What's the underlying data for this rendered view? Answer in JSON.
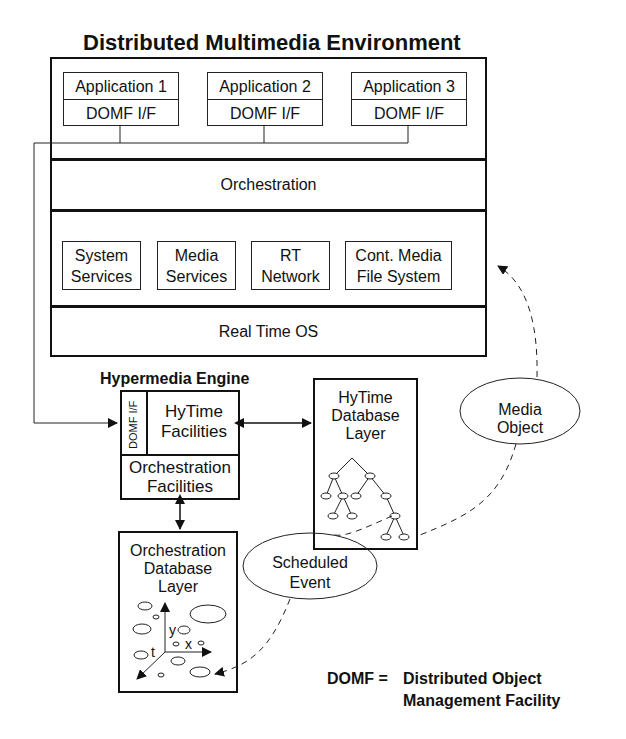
{
  "diagram": {
    "title": "Distributed Multimedia Environment",
    "applications": [
      {
        "name": "Application 1",
        "interface": "DOMF I/F"
      },
      {
        "name": "Application 2",
        "interface": "DOMF I/F"
      },
      {
        "name": "Application 3",
        "interface": "DOMF I/F"
      }
    ],
    "layers": {
      "orchestration": "Orchestration",
      "real_time_os": "Real Time OS"
    },
    "services": [
      {
        "line1": "System",
        "line2": "Services"
      },
      {
        "line1": "Media",
        "line2": "Services"
      },
      {
        "line1": "RT",
        "line2": "Network"
      },
      {
        "line1": "Cont. Media",
        "line2": "File System"
      }
    ],
    "hypermedia_engine": {
      "title": "Hypermedia Engine",
      "domf_if": "DOMF I/F",
      "hytime_line1": "HyTime",
      "hytime_line2": "Facilities",
      "orch_line1": "Orchestration",
      "orch_line2": "Facilities"
    },
    "hytime_db": {
      "line1": "HyTime",
      "line2": "Database",
      "line3": "Layer"
    },
    "orch_db": {
      "line1": "Orchestration",
      "line2": "Database",
      "line3": "Layer",
      "axis_y": "y",
      "axis_x": "x",
      "axis_t": "t"
    },
    "media_object": {
      "line1": "Media",
      "line2": "Object"
    },
    "scheduled_event": {
      "line1": "Scheduled",
      "line2": "Event"
    },
    "legend": {
      "term": "DOMF =",
      "line1": "Distributed Object",
      "line2": "Management Facility"
    }
  }
}
